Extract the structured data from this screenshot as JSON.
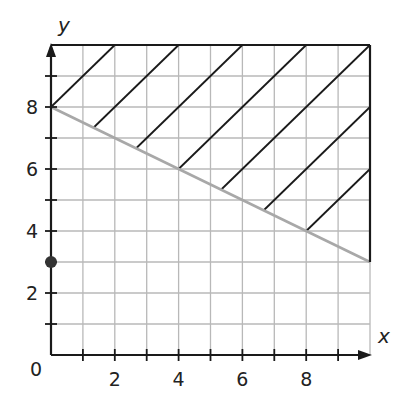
{
  "chart_data": {
    "type": "line",
    "title": "",
    "xlabel": "x",
    "ylabel": "y",
    "xlim": [
      0,
      10
    ],
    "ylim": [
      0,
      10
    ],
    "grid": true,
    "x_tick_labels": [
      "0",
      "2",
      "4",
      "6",
      "8"
    ],
    "y_tick_labels": [
      "2",
      "4",
      "6",
      "8"
    ],
    "origin_label": "0",
    "series": [
      {
        "name": "boundary line",
        "style": "solid gray",
        "equation": "y = 8 - x/2",
        "x": [
          0,
          10
        ],
        "y": [
          8,
          3
        ]
      }
    ],
    "points": [
      {
        "name": "y-intercept dot",
        "x": 0,
        "y": 3,
        "style": "filled"
      }
    ],
    "shaded_region": {
      "description": "hatched region above boundary line y = 8 - 0.5x within 0<=x<=10, y<=10",
      "inequality": "y > 8 - 0.5x",
      "hatch_lines": [
        {
          "from": [
            0,
            8
          ],
          "to": [
            2,
            10
          ]
        },
        {
          "from": [
            1.33,
            7.33
          ],
          "to": [
            4,
            10
          ]
        },
        {
          "from": [
            2.67,
            6.67
          ],
          "to": [
            6,
            10
          ]
        },
        {
          "from": [
            4,
            6
          ],
          "to": [
            8,
            10
          ]
        },
        {
          "from": [
            5.33,
            5.33
          ],
          "to": [
            10,
            10
          ]
        },
        {
          "from": [
            6.67,
            4.67
          ],
          "to": [
            10,
            8
          ]
        },
        {
          "from": [
            8,
            4
          ],
          "to": [
            10,
            6
          ]
        }
      ]
    },
    "colors": {
      "grid": "#b8b8b8",
      "axis": "#1a1a1a",
      "boundary": "#a8a8a8",
      "hatch": "#1a1a1a",
      "point": "#333333"
    }
  }
}
